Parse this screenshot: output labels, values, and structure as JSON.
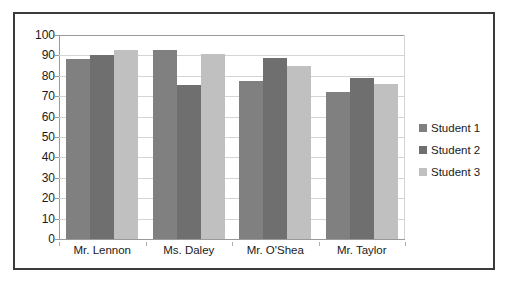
{
  "chart_data": {
    "type": "bar",
    "title": "",
    "subtitle": "",
    "xlabel": "",
    "ylabel": "",
    "categories": [
      "Mr. Lennon",
      "Ms. Daley",
      "Mr. O'Shea",
      "Mr. Taylor"
    ],
    "series": [
      {
        "name": "Student 1",
        "color": "#808080",
        "values": [
          88,
          92.5,
          77.5,
          72
        ]
      },
      {
        "name": "Student 2",
        "color": "#6f6f6f",
        "values": [
          90,
          75.5,
          88.5,
          79
        ]
      },
      {
        "name": "Student 3",
        "color": "#c0c0c0",
        "values": [
          92.5,
          90.5,
          85,
          76
        ]
      }
    ],
    "ylim": [
      0,
      100
    ],
    "ytick_labels": [
      "100",
      "90",
      "80",
      "70",
      "60",
      "50",
      "40",
      "30",
      "20",
      "10",
      "0"
    ],
    "ytick_values": [
      100,
      90,
      80,
      70,
      60,
      50,
      40,
      30,
      20,
      10,
      0
    ],
    "grid": true,
    "grid_axis": "y",
    "legend_position": "right",
    "bar_mode": "grouped",
    "gap_between_bars_in_group": 0
  },
  "legend": {
    "entries": [
      {
        "label": "Student 1",
        "color": "#808080"
      },
      {
        "label": "Student 2",
        "color": "#6f6f6f"
      },
      {
        "label": "Student 3",
        "color": "#c0c0c0"
      }
    ]
  },
  "colors": {
    "frame_border": "#3b3b3b",
    "gridline": "#d4d4d4",
    "axis_line": "#9a9a9a",
    "text": "#1a1a1a",
    "background": "#ffffff"
  }
}
